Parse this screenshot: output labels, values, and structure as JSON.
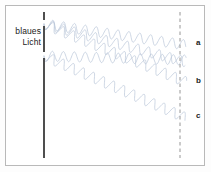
{
  "figure": {
    "source_label_line1": "blaues",
    "source_label_line2": "Licht",
    "background_color": "#ffffff",
    "frame_color": "#b9b9b9"
  },
  "barrier": {
    "name": "barrier-line",
    "color": "#3b3b3b",
    "x": 44,
    "y_top": 12,
    "y_bottom": 158,
    "gap1_y_top": 20,
    "gap1_y_bottom": 26,
    "gap2_y_top": 52,
    "gap2_y_bottom": 58
  },
  "screen": {
    "name": "screen-line",
    "color": "#8a8a8a",
    "x": 180,
    "y_top": 12,
    "y_bottom": 158,
    "style": "dashed"
  },
  "waves": {
    "color": "#b9c6d8",
    "stroke_width": 0.7,
    "wavelength_px": 11,
    "amplitude_px": 5,
    "rays": [
      {
        "label": "a",
        "origin_x": 44,
        "origin_y": 24,
        "end_x": 186,
        "end_y": 45,
        "label_x": 196,
        "label_y": 42
      },
      {
        "label": "b",
        "origin_x": 44,
        "origin_y": 24,
        "end_x": 186,
        "end_y": 82,
        "label_x": 196,
        "label_y": 80
      },
      {
        "label": "c",
        "origin_x": 44,
        "origin_y": 56,
        "end_x": 186,
        "end_y": 118,
        "label_x": 196,
        "label_y": 115
      },
      {
        "label": "",
        "origin_x": 44,
        "origin_y": 56,
        "end_x": 186,
        "end_y": 60,
        "label_x": 0,
        "label_y": 0
      },
      {
        "label": "",
        "origin_x": 44,
        "origin_y": 24,
        "end_x": 186,
        "end_y": 62,
        "label_x": 0,
        "label_y": 0
      }
    ]
  },
  "labels": {
    "a": "a",
    "b": "b",
    "c": "c"
  }
}
